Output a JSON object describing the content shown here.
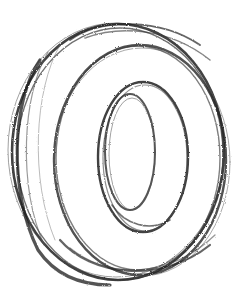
{
  "image": {
    "subject": "pencil sketch of a ring / tire shape in three-quarter view",
    "background_color": "#ffffff",
    "stroke_color": "#2a2a2a"
  }
}
